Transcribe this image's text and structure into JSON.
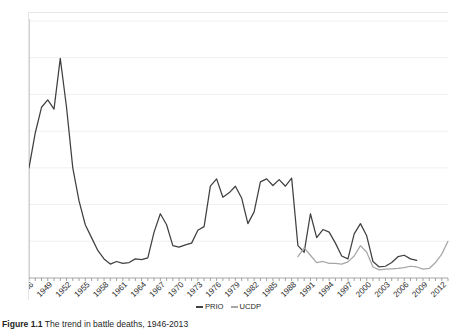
{
  "figure": {
    "caption_label": "Figure 1.1",
    "caption_text": "The trend in battle deaths, 1946-2013"
  },
  "legend": {
    "position": "bottom-center",
    "items": [
      {
        "label": "PRIO",
        "color": "#404040",
        "marker": "line"
      },
      {
        "label": "UCDP",
        "color": "#a6a6a6",
        "marker": "line"
      }
    ]
  },
  "chart_data": {
    "type": "line",
    "title": "",
    "subtitle": "",
    "xlabel": "",
    "ylabel": "Number of battle deaths",
    "ylim": [
      0,
      700000
    ],
    "ytick_step": 100000,
    "ytick_labels": [
      "0",
      "100000",
      "200000",
      "300000",
      "400000",
      "500000",
      "600000",
      "700000"
    ],
    "xlim": [
      1946,
      2013
    ],
    "xtick_step": 1,
    "xtick_label_step": 3,
    "xtick_labels": [
      "1946",
      "1949",
      "1952",
      "1955",
      "1958",
      "1961",
      "1964",
      "1967",
      "1970",
      "1973",
      "1976",
      "1979",
      "1982",
      "1985",
      "1988",
      "1991",
      "1994",
      "1997",
      "2000",
      "2003",
      "2006",
      "2009",
      "2012"
    ],
    "grid": "horizontal",
    "legend_position": "bottom-center",
    "x": [
      1946,
      1947,
      1948,
      1949,
      1950,
      1951,
      1952,
      1953,
      1954,
      1955,
      1956,
      1957,
      1958,
      1959,
      1960,
      1961,
      1962,
      1963,
      1964,
      1965,
      1966,
      1967,
      1968,
      1969,
      1970,
      1971,
      1972,
      1973,
      1974,
      1975,
      1976,
      1977,
      1978,
      1979,
      1980,
      1981,
      1982,
      1983,
      1984,
      1985,
      1986,
      1987,
      1988,
      1989,
      1990,
      1991,
      1992,
      1993,
      1994,
      1995,
      1996,
      1997,
      1998,
      1999,
      2000,
      2001,
      2002,
      2003,
      2004,
      2005,
      2006,
      2007,
      2008,
      2009,
      2010,
      2011,
      2012,
      2013
    ],
    "series": [
      {
        "name": "PRIO",
        "color": "#404040",
        "x_start": 1946,
        "x_end": 2008,
        "values": [
          300000,
          395000,
          465000,
          485000,
          460000,
          598000,
          465000,
          300000,
          210000,
          145000,
          110000,
          75000,
          52000,
          38000,
          45000,
          40000,
          42000,
          52000,
          50000,
          55000,
          125000,
          175000,
          145000,
          88000,
          84000,
          90000,
          95000,
          130000,
          140000,
          250000,
          270000,
          220000,
          232000,
          250000,
          218000,
          148000,
          180000,
          262000,
          270000,
          252000,
          268000,
          250000,
          272000,
          88000,
          70000,
          175000,
          110000,
          132000,
          125000,
          95000,
          60000,
          52000,
          120000,
          148000,
          115000,
          45000,
          30000,
          32000,
          42000,
          58000,
          62000,
          52000,
          48000,
          null,
          null,
          null,
          null,
          null
        ]
      },
      {
        "name": "UCDP",
        "color": "#a6a6a6",
        "x_start": 1989,
        "x_end": 2013,
        "values": [
          null,
          null,
          null,
          null,
          null,
          null,
          null,
          null,
          null,
          null,
          null,
          null,
          null,
          null,
          null,
          null,
          null,
          null,
          null,
          null,
          null,
          null,
          null,
          null,
          null,
          null,
          null,
          null,
          null,
          null,
          null,
          null,
          null,
          null,
          null,
          null,
          null,
          null,
          null,
          null,
          null,
          null,
          null,
          58000,
          82000,
          62000,
          42000,
          45000,
          40000,
          40000,
          38000,
          44000,
          60000,
          88000,
          70000,
          30000,
          22000,
          24000,
          25000,
          26000,
          28000,
          32000,
          30000,
          24000,
          26000,
          42000,
          65000,
          100000
        ]
      }
    ]
  }
}
